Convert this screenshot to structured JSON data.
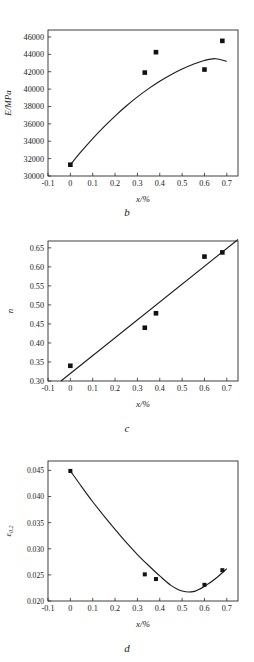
{
  "figure": {
    "panels": [
      "b",
      "c",
      "d"
    ]
  },
  "chart_data": [
    {
      "type": "scatter",
      "panel_label": "b",
      "title": "",
      "xlabel": "x/%",
      "ylabel": "E/MPa",
      "xlim": [
        -0.1,
        0.75
      ],
      "ylim": [
        30000,
        46800
      ],
      "xticks": [
        -0.1,
        0,
        0.1,
        0.2,
        0.3,
        0.4,
        0.5,
        0.6,
        0.7
      ],
      "xtick_labels": [
        "-0.1",
        "0",
        "0.1",
        "0.2",
        "0.3",
        "0.4",
        "0.5",
        "0.6",
        "0.7"
      ],
      "yticks": [
        30000,
        32000,
        34000,
        36000,
        38000,
        40000,
        42000,
        44000,
        46000
      ],
      "ytick_labels": [
        "30000",
        "32000",
        "34000",
        "36000",
        "38000",
        "40000",
        "42000",
        "44000",
        "46000"
      ],
      "grid": false,
      "legend": "none",
      "points": [
        {
          "x": 0.0,
          "y": 31300
        },
        {
          "x": 0.333,
          "y": 41900
        },
        {
          "x": 0.383,
          "y": 44250
        },
        {
          "x": 0.6,
          "y": 42250
        },
        {
          "x": 0.68,
          "y": 45550
        }
      ],
      "fit_curve": {
        "kind": "quadratic-fit",
        "x": [
          0.0,
          0.05,
          0.1,
          0.15,
          0.2,
          0.25,
          0.3,
          0.35,
          0.4,
          0.45,
          0.5,
          0.55,
          0.6,
          0.65,
          0.7
        ],
        "y": [
          31300,
          32850,
          34300,
          35650,
          36900,
          38050,
          39100,
          40050,
          40900,
          41650,
          42300,
          42850,
          43300,
          43500,
          43200
        ]
      }
    },
    {
      "type": "scatter",
      "panel_label": "c",
      "title": "",
      "xlabel": "x/%",
      "ylabel": "n",
      "xlim": [
        -0.1,
        0.75
      ],
      "ylim": [
        0.3,
        0.668
      ],
      "xticks": [
        -0.1,
        0,
        0.1,
        0.2,
        0.3,
        0.4,
        0.5,
        0.6,
        0.7
      ],
      "xtick_labels": [
        "-0.1",
        "0",
        "0.1",
        "0.2",
        "0.3",
        "0.4",
        "0.5",
        "0.6",
        "0.7"
      ],
      "yticks": [
        0.3,
        0.35,
        0.4,
        0.45,
        0.5,
        0.55,
        0.6,
        0.65
      ],
      "ytick_labels": [
        "0.30",
        "0.35",
        "0.40",
        "0.45",
        "0.50",
        "0.55",
        "0.60",
        "0.65"
      ],
      "grid": false,
      "legend": "none",
      "points": [
        {
          "x": 0.0,
          "y": 0.34
        },
        {
          "x": 0.333,
          "y": 0.44
        },
        {
          "x": 0.383,
          "y": 0.478
        },
        {
          "x": 0.6,
          "y": 0.627
        },
        {
          "x": 0.68,
          "y": 0.638
        }
      ],
      "fit_curve": {
        "kind": "linear-fit",
        "x": [
          -0.042,
          0.75
        ],
        "y": [
          0.3,
          0.672
        ]
      }
    },
    {
      "type": "scatter",
      "panel_label": "d",
      "title": "",
      "xlabel": "x/%",
      "ylabel": "e0.2",
      "ylabel_base": "ε",
      "ylabel_subscript": "0.2",
      "xlim": [
        -0.1,
        0.75
      ],
      "ylim": [
        0.02,
        0.0468
      ],
      "xticks": [
        -0.1,
        0,
        0.1,
        0.2,
        0.3,
        0.4,
        0.5,
        0.6,
        0.7
      ],
      "xtick_labels": [
        "-0.1",
        "0",
        "0.1",
        "0.2",
        "0.3",
        "0.4",
        "0.5",
        "0.6",
        "0.7"
      ],
      "yticks": [
        0.02,
        0.025,
        0.03,
        0.035,
        0.04,
        0.045
      ],
      "ytick_labels": [
        "0.020",
        "0.025",
        "0.030",
        "0.035",
        "0.040",
        "0.045"
      ],
      "grid": false,
      "legend": "none",
      "points": [
        {
          "x": 0.0,
          "y": 0.0449
        },
        {
          "x": 0.333,
          "y": 0.0251
        },
        {
          "x": 0.383,
          "y": 0.0242
        },
        {
          "x": 0.6,
          "y": 0.0231
        },
        {
          "x": 0.68,
          "y": 0.0259
        }
      ],
      "fit_curve": {
        "kind": "quadratic-fit",
        "x": [
          0.0,
          0.05,
          0.1,
          0.15,
          0.2,
          0.25,
          0.3,
          0.35,
          0.4,
          0.45,
          0.5,
          0.55,
          0.6,
          0.65,
          0.7
        ],
        "y": [
          0.0449,
          0.0419,
          0.039,
          0.0363,
          0.0337,
          0.0312,
          0.0289,
          0.0268,
          0.0248,
          0.023,
          0.0219,
          0.0218,
          0.0228,
          0.0243,
          0.0262
        ]
      }
    }
  ]
}
